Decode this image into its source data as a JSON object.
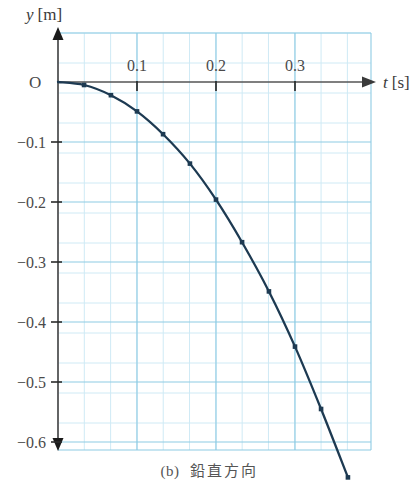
{
  "figure": {
    "caption_label": "(b)",
    "caption_text": "鉛直方向",
    "y_axis_label_var": "y",
    "y_axis_label_unit": "[m]",
    "t_axis_label_var": "t",
    "t_axis_label_unit": "[s]",
    "origin_label": "O"
  },
  "colors": {
    "curve": "#1d3a52",
    "grid_minor": "#cfeaf5",
    "grid_major": "#8ecbe4",
    "axis": "#555555",
    "text": "#4a4a4a",
    "background": "#ffffff"
  },
  "chart_data": {
    "type": "line",
    "title": "",
    "subtitle": "",
    "xlabel": "t [s]",
    "ylabel": "y [m]",
    "xlim": [
      -0.02,
      0.4
    ],
    "ylim": [
      -0.68,
      0.03
    ],
    "grid": true,
    "legend": null,
    "x_ticks": [
      0.1,
      0.2,
      0.3
    ],
    "x_tick_labels": [
      "0.1",
      "0.2",
      "0.3"
    ],
    "y_ticks": [
      -0.1,
      -0.2,
      -0.3,
      -0.4,
      -0.5,
      -0.6
    ],
    "y_tick_labels": [
      "−0.1",
      "−0.2",
      "−0.3",
      "−0.4",
      "−0.5",
      "−0.6"
    ],
    "x_minor_step": 0.0333,
    "y_minor_step": 0.05,
    "series": [
      {
        "name": "vertical displacement",
        "marker": "square",
        "x": [
          0.0,
          0.033,
          0.067,
          0.1,
          0.133,
          0.167,
          0.2,
          0.233,
          0.267,
          0.3,
          0.333,
          0.367
        ],
        "y": [
          0.0,
          -0.005,
          -0.022,
          -0.049,
          -0.087,
          -0.136,
          -0.196,
          -0.267,
          -0.349,
          -0.441,
          -0.545,
          -0.659
        ]
      }
    ]
  }
}
